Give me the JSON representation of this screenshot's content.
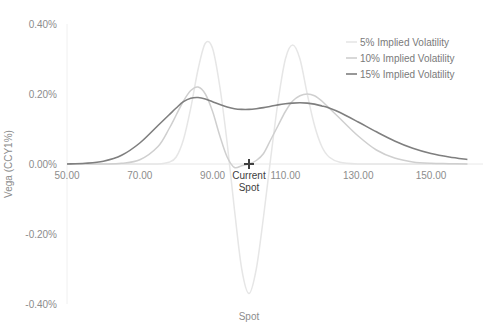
{
  "chart_data": {
    "type": "line",
    "title": "",
    "xlabel": "Spot",
    "ylabel": "Vega (CCY1%)",
    "xlim": [
      50,
      160
    ],
    "ylim": [
      -0.4,
      0.4
    ],
    "x_ticks": [
      50,
      70,
      90,
      110,
      130,
      150
    ],
    "x_tick_labels": [
      "50.00",
      "70.00",
      "90.00",
      "110.00",
      "130.00",
      "150.00"
    ],
    "y_ticks": [
      0.4,
      0.2,
      0.0,
      -0.2,
      -0.4
    ],
    "y_tick_labels": [
      "0.40%",
      "0.20%",
      "0.00%",
      "-0.20%",
      "-0.40%"
    ],
    "grid": false,
    "legend_position": "top-right",
    "annotations": [
      {
        "label": "Current Spot",
        "x": 100,
        "y": 0.0,
        "marker": "+"
      }
    ],
    "x": [
      50,
      55,
      60,
      65,
      70,
      75,
      78,
      80,
      82,
      84,
      86,
      88,
      90,
      92,
      94,
      96,
      98,
      100,
      102,
      104,
      106,
      108,
      110,
      112,
      114,
      116,
      118,
      120,
      122,
      125,
      130,
      135,
      140,
      145,
      150,
      155,
      160
    ],
    "series": [
      {
        "name": "5% Implied Volatility",
        "color": "#e6e6e6",
        "values": [
          0,
          0,
          0,
          0,
          0,
          0,
          0.005,
          0.02,
          0.07,
          0.16,
          0.27,
          0.345,
          0.33,
          0.22,
          0.06,
          -0.13,
          -0.3,
          -0.37,
          -0.3,
          -0.15,
          0.02,
          0.18,
          0.3,
          0.34,
          0.3,
          0.2,
          0.11,
          0.05,
          0.02,
          0.005,
          0,
          0,
          0,
          0,
          0,
          0,
          0
        ]
      },
      {
        "name": "10% Implied Volatility",
        "color": "#cfcfcf",
        "values": [
          0,
          0,
          0,
          0.002,
          0.012,
          0.05,
          0.1,
          0.14,
          0.18,
          0.21,
          0.22,
          0.2,
          0.15,
          0.08,
          0.02,
          -0.01,
          -0.005,
          0.0,
          0.01,
          0.03,
          0.07,
          0.11,
          0.15,
          0.18,
          0.195,
          0.2,
          0.195,
          0.18,
          0.16,
          0.13,
          0.08,
          0.04,
          0.017,
          0.006,
          0.002,
          0.001,
          0
        ]
      },
      {
        "name": "15% Implied Volatility",
        "color": "#7f7f7f",
        "values": [
          0.0,
          0.002,
          0.008,
          0.025,
          0.06,
          0.11,
          0.14,
          0.16,
          0.178,
          0.188,
          0.19,
          0.186,
          0.178,
          0.17,
          0.163,
          0.158,
          0.156,
          0.156,
          0.158,
          0.161,
          0.165,
          0.169,
          0.172,
          0.174,
          0.175,
          0.174,
          0.171,
          0.166,
          0.16,
          0.147,
          0.12,
          0.092,
          0.066,
          0.045,
          0.03,
          0.02,
          0.013
        ]
      }
    ]
  },
  "legend": {
    "items": [
      {
        "label": "5% Implied Volatility",
        "color": "#e6e6e6"
      },
      {
        "label": "10% Implied Volatility",
        "color": "#cfcfcf"
      },
      {
        "label": "15% Implied Volatility",
        "color": "#7f7f7f"
      }
    ]
  },
  "annotation": {
    "line1": "Current",
    "line2": "Spot"
  },
  "axes": {
    "xlabel": "Spot",
    "ylabel": "Vega (CCY1%)"
  }
}
